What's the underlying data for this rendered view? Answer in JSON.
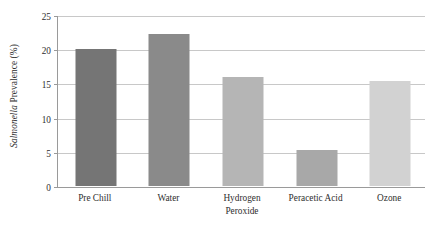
{
  "chart_data": {
    "type": "bar",
    "title": "",
    "xlabel": "",
    "ylabel_italic": "Salmonella",
    "ylabel_rest": " Prevalence (%)",
    "ylabel": "Salmonella Prevalence (%)",
    "categories": [
      "Pre Chill",
      "Water",
      "Hydrogen Peroxide",
      "Peracetic Acid",
      "Ozone"
    ],
    "category_lines": [
      [
        "Pre Chill"
      ],
      [
        "Water"
      ],
      [
        "Hydrogen",
        "Peroxide"
      ],
      [
        "Peracetic Acid"
      ],
      [
        "Ozone"
      ]
    ],
    "values": [
      20.0,
      22.2,
      16.0,
      5.3,
      15.3
    ],
    "bar_colors": [
      "#757575",
      "#8a8a8a",
      "#b5b5b5",
      "#a8a8a8",
      "#d2d2d2"
    ],
    "ylim": [
      0,
      25
    ],
    "yticks": [
      0,
      5,
      10,
      15,
      20,
      25
    ],
    "ytick_labels": [
      "0",
      "5",
      "10",
      "15",
      "20",
      "25"
    ],
    "grid": true,
    "grid_axis": "y",
    "legend": "none",
    "axis_color": "#9a9a9a",
    "grid_color": "#c8c8c8",
    "text_color": "#2e2e2e",
    "background": "#ffffff"
  }
}
